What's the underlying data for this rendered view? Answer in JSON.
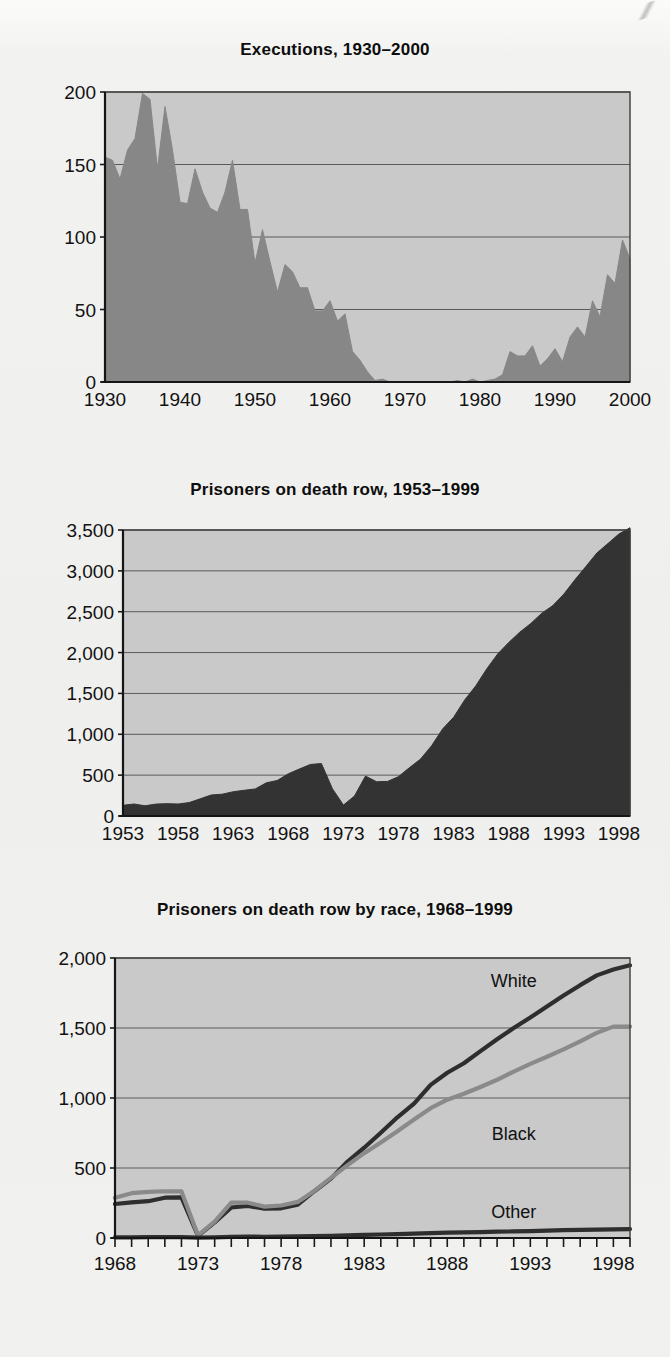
{
  "page": {
    "background_color": "#efefed",
    "figure_count": 3
  },
  "colors": {
    "plot_background": "#c9c9c9",
    "area_fill_medium": "#878787",
    "area_fill_dark": "#333333",
    "line_dark": "#2e2e2e",
    "line_gray": "#8a8a8a",
    "gridline": "#5a5a5a",
    "axis": "#151515",
    "text": "#111111"
  },
  "chart_data": [
    {
      "id": "executions-1930-2000",
      "type": "area",
      "title": "Executions, 1930–2000",
      "xlabel": "",
      "ylabel": "",
      "grid": true,
      "legend": "none",
      "xlim": [
        1930,
        2000
      ],
      "ylim": [
        0,
        200
      ],
      "ytick_labels": [
        "0",
        "50",
        "100",
        "150",
        "200"
      ],
      "ytick_values": [
        0,
        50,
        100,
        150,
        200
      ],
      "xtick_labels": [
        "1930",
        "1940",
        "1950",
        "1960",
        "1970",
        "1980",
        "1990",
        "2000"
      ],
      "xtick_values": [
        1930,
        1940,
        1950,
        1960,
        1970,
        1980,
        1990,
        2000
      ],
      "x": [
        1930,
        1931,
        1932,
        1933,
        1934,
        1935,
        1936,
        1937,
        1938,
        1939,
        1940,
        1941,
        1942,
        1943,
        1944,
        1945,
        1946,
        1947,
        1948,
        1949,
        1950,
        1951,
        1952,
        1953,
        1954,
        1955,
        1956,
        1957,
        1958,
        1959,
        1960,
        1961,
        1962,
        1963,
        1964,
        1965,
        1966,
        1967,
        1968,
        1969,
        1970,
        1971,
        1972,
        1973,
        1974,
        1975,
        1976,
        1977,
        1978,
        1979,
        1980,
        1981,
        1982,
        1983,
        1984,
        1985,
        1986,
        1987,
        1988,
        1989,
        1990,
        1991,
        1992,
        1993,
        1994,
        1995,
        1996,
        1997,
        1998,
        1999,
        2000
      ],
      "values": [
        155,
        153,
        140,
        160,
        168,
        199,
        195,
        147,
        190,
        160,
        124,
        123,
        147,
        131,
        120,
        117,
        131,
        153,
        119,
        119,
        82,
        105,
        83,
        62,
        81,
        76,
        65,
        65,
        49,
        49,
        56,
        42,
        47,
        21,
        15,
        7,
        1,
        2,
        0,
        0,
        0,
        0,
        0,
        0,
        0,
        0,
        0,
        1,
        0,
        2,
        0,
        1,
        2,
        5,
        21,
        18,
        18,
        25,
        11,
        16,
        23,
        14,
        31,
        38,
        31,
        56,
        45,
        74,
        68,
        98,
        85
      ],
      "series": [
        {
          "name": "Executions",
          "fill": "#878787",
          "values_ref": "values"
        }
      ]
    },
    {
      "id": "death-row-1953-1999",
      "type": "area",
      "title": "Prisoners on death row, 1953–1999",
      "xlabel": "",
      "ylabel": "",
      "grid": true,
      "legend": "none",
      "xlim": [
        1953,
        1999
      ],
      "ylim": [
        0,
        3500
      ],
      "ytick_labels": [
        "0",
        "500",
        "1,000",
        "1,500",
        "2,000",
        "2,500",
        "3,000",
        "3,500"
      ],
      "ytick_values": [
        0,
        500,
        1000,
        1500,
        2000,
        2500,
        3000,
        3500
      ],
      "xtick_labels": [
        "1953",
        "1958",
        "1963",
        "1968",
        "1973",
        "1978",
        "1983",
        "1988",
        "1993",
        "1998"
      ],
      "xtick_values": [
        1953,
        1958,
        1963,
        1968,
        1973,
        1978,
        1983,
        1988,
        1993,
        1998
      ],
      "x": [
        1953,
        1954,
        1955,
        1956,
        1957,
        1958,
        1959,
        1960,
        1961,
        1962,
        1963,
        1964,
        1965,
        1966,
        1967,
        1968,
        1969,
        1970,
        1971,
        1972,
        1973,
        1974,
        1975,
        1976,
        1977,
        1978,
        1979,
        1980,
        1981,
        1982,
        1983,
        1984,
        1985,
        1986,
        1987,
        1988,
        1989,
        1990,
        1991,
        1992,
        1993,
        1994,
        1995,
        1996,
        1997,
        1998,
        1999
      ],
      "values": [
        131,
        147,
        125,
        146,
        151,
        147,
        164,
        210,
        257,
        267,
        297,
        315,
        331,
        406,
        435,
        517,
        575,
        631,
        642,
        334,
        134,
        244,
        488,
        420,
        423,
        482,
        593,
        697,
        860,
        1066,
        1209,
        1420,
        1591,
        1800,
        1984,
        2124,
        2250,
        2356,
        2482,
        2575,
        2716,
        2890,
        3054,
        3219,
        3335,
        3452,
        3527
      ],
      "series": [
        {
          "name": "Prisoners on death row",
          "fill": "#333333",
          "values_ref": "values"
        }
      ]
    },
    {
      "id": "death-row-by-race-1968-1999",
      "type": "line",
      "title": "Prisoners on death row by race, 1968–1999",
      "xlabel": "",
      "ylabel": "",
      "grid": true,
      "legend": "inline-labels",
      "xlim": [
        1968,
        1999
      ],
      "ylim": [
        0,
        2000
      ],
      "ytick_labels": [
        "0",
        "500",
        "1,000",
        "1,500",
        "2,000"
      ],
      "ytick_values": [
        0,
        500,
        1000,
        1500,
        2000
      ],
      "xtick_labels": [
        "1968",
        "1973",
        "1978",
        "1983",
        "1988",
        "1993",
        "1998"
      ],
      "xtick_values": [
        1968,
        1973,
        1978,
        1983,
        1988,
        1993,
        1998
      ],
      "minor_xticks": true,
      "x": [
        1968,
        1969,
        1970,
        1971,
        1972,
        1973,
        1974,
        1975,
        1976,
        1977,
        1978,
        1979,
        1980,
        1981,
        1982,
        1983,
        1984,
        1985,
        1986,
        1987,
        1988,
        1989,
        1990,
        1991,
        1992,
        1993,
        1994,
        1995,
        1996,
        1997,
        1998,
        1999
      ],
      "series": [
        {
          "name": "White",
          "color": "#2e2e2e",
          "values": [
            243,
            255,
            263,
            288,
            290,
            15,
            111,
            218,
            229,
            209,
            212,
            238,
            334,
            424,
            546,
            645,
            752,
            862,
            960,
            1094,
            1180,
            1248,
            1335,
            1420,
            1500,
            1575,
            1653,
            1732,
            1806,
            1876,
            1918,
            1948
          ],
          "label": "White",
          "label_x": 1992,
          "label_y": 1790
        },
        {
          "name": "Black",
          "color": "#8a8a8a",
          "values": [
            287,
            320,
            330,
            334,
            333,
            18,
            117,
            253,
            252,
            224,
            232,
            258,
            336,
            430,
            520,
            606,
            682,
            763,
            846,
            927,
            988,
            1030,
            1079,
            1130,
            1189,
            1244,
            1295,
            1347,
            1404,
            1465,
            1510,
            1510
          ],
          "label": "Black",
          "label_x": 1992,
          "label_y": 700
        },
        {
          "name": "Other",
          "color": "#2e2e2e",
          "values": [
            4,
            5,
            6,
            6,
            6,
            2,
            4,
            8,
            10,
            9,
            10,
            12,
            14,
            16,
            19,
            22,
            25,
            28,
            31,
            35,
            38,
            40,
            42,
            45,
            47,
            49,
            52,
            56,
            58,
            60,
            62,
            64
          ],
          "label": "Other",
          "label_x": 1992,
          "label_y": 140
        }
      ]
    }
  ]
}
